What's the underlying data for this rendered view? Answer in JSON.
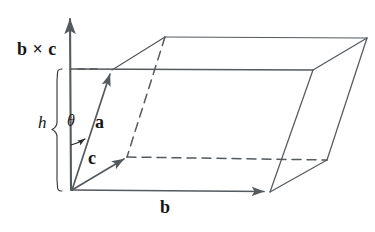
{
  "figure": {
    "background_color": "#ffffff",
    "line_color": "#555a5e",
    "text_color": "#161616",
    "labels": {
      "normal": "b × c",
      "height": "h",
      "angle": "θ",
      "vector_a": "a",
      "vector_b": "b",
      "vector_c": "c"
    },
    "icon_names": {
      "axis": "up-arrow-axis-icon",
      "brace": "height-brace-icon",
      "arc": "angle-arc-icon"
    },
    "geometry": {
      "origin": [
        72,
        190
      ],
      "axis_tip": [
        70,
        14
      ],
      "vector_a_tip": [
        112,
        70
      ],
      "vector_b_tip": [
        270,
        192
      ],
      "vector_c_tip": [
        127,
        157
      ],
      "top_face": [
        [
          112,
          70
        ],
        [
          165,
          37
        ],
        [
          367,
          38
        ],
        [
          313,
          70
        ]
      ],
      "height_line": [
        [
          70,
          69
        ],
        [
          313,
          70
        ]
      ],
      "base_hidden_corner": [
        127,
        157
      ],
      "base_far_corner": [
        326,
        160
      ],
      "brace_span": [
        69,
        190
      ]
    }
  }
}
